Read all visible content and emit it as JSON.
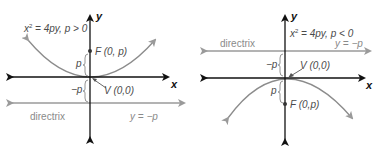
{
  "colors": {
    "axis": "#111111",
    "parabola": "#8c8c8c",
    "directrix": "#9a9a9a",
    "text": "#4a4a4a",
    "directrix_text": "#8a8a8a"
  },
  "left": {
    "equation_prefix": "x",
    "equation_sup": "2",
    "equation_rest": " = 4py, p > 0",
    "axis_y": "y",
    "axis_x": "x",
    "focus_label": "F (0, p)",
    "vertex_label": "V (0,0)",
    "p_label": "p",
    "neg_p_label": "−p",
    "directrix_label": "directrix",
    "directrix_eq": "y = −p"
  },
  "right": {
    "equation_prefix": "x",
    "equation_sup": "2",
    "equation_rest": " = 4py, p < 0",
    "axis_y": "y",
    "axis_x": "x",
    "focus_label": "F (0,p)",
    "vertex_label": "V (0,0)",
    "p_label": "p",
    "neg_p_label": "−p",
    "directrix_label": "directrix",
    "directrix_eq": "y = −p"
  }
}
